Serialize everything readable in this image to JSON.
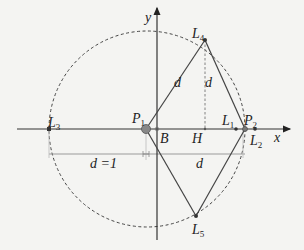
{
  "diagram": {
    "axes": {
      "x_label": "x",
      "y_label": "y"
    },
    "points": {
      "L1": {
        "label": "L",
        "sub": "1"
      },
      "L2": {
        "label": "L",
        "sub": "2"
      },
      "L3": {
        "label": "L",
        "sub": "3"
      },
      "L4": {
        "label": "L",
        "sub": "4"
      },
      "L5": {
        "label": "L",
        "sub": "5"
      },
      "P1": {
        "label": "P",
        "sub": "1"
      },
      "P2": {
        "label": "P",
        "sub": "2"
      },
      "B": {
        "label": "B"
      },
      "H": {
        "label": "H"
      }
    },
    "segment_labels": {
      "P1_L4": "d",
      "L4_P2": "d",
      "dim_left": "d =1",
      "dim_right": "d"
    },
    "colors": {
      "line": "#333333",
      "dashed": "#444444",
      "dimension": "#999999",
      "background": "#f4f4f2"
    }
  }
}
